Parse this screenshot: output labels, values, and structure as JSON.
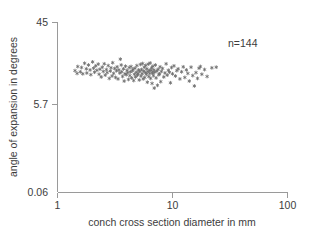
{
  "figure": {
    "background_color": "#ffffff",
    "axis_color": "#9a9a9a",
    "text_color": "#3c3c3c",
    "marker_color": "#6e6e6e"
  },
  "annotations": {
    "sample_size": "n=144"
  },
  "axes": {
    "x_title": "conch cross section diameter in mm",
    "y_title": "angle of expansion in degrees",
    "x_ticks": [
      "1",
      "10",
      "100"
    ],
    "y_ticks": [
      "45",
      "5.7",
      "0.06"
    ]
  },
  "chart_data": {
    "type": "scatter",
    "title": "",
    "xlabel": "conch cross section diameter in mm",
    "ylabel": "angle of expansion in degrees",
    "xscale": "log",
    "yscale": "log",
    "xlim": [
      1,
      100
    ],
    "ylim": [
      0.06,
      45
    ],
    "xticks": [
      1,
      10,
      100
    ],
    "yticks": [
      0.06,
      5.7,
      45
    ],
    "grid": false,
    "legend": null,
    "marker": "star",
    "marker_color": "#6e6e6e",
    "n": 144,
    "annotations": [
      {
        "text": "n=144",
        "x": 30.0,
        "y": 26.0
      }
    ],
    "points": [
      [
        1.42,
        6.9
      ],
      [
        1.5,
        8.1
      ],
      [
        1.48,
        6.2
      ],
      [
        1.58,
        6.6
      ],
      [
        1.62,
        7.8
      ],
      [
        1.66,
        6.1
      ],
      [
        1.72,
        9.2
      ],
      [
        1.78,
        7.4
      ],
      [
        1.8,
        6.3
      ],
      [
        1.86,
        8.6
      ],
      [
        1.92,
        7.1
      ],
      [
        1.95,
        5.9
      ],
      [
        2.02,
        9.7
      ],
      [
        2.06,
        7.6
      ],
      [
        2.1,
        6.5
      ],
      [
        2.15,
        8.3
      ],
      [
        2.2,
        7.0
      ],
      [
        2.26,
        8.9
      ],
      [
        2.3,
        6.0
      ],
      [
        2.34,
        7.3
      ],
      [
        2.4,
        5.4
      ],
      [
        2.45,
        7.9
      ],
      [
        2.5,
        6.7
      ],
      [
        2.55,
        9.0
      ],
      [
        2.6,
        5.8
      ],
      [
        2.66,
        7.2
      ],
      [
        2.7,
        6.4
      ],
      [
        2.76,
        8.4
      ],
      [
        2.82,
        5.1
      ],
      [
        2.88,
        6.8
      ],
      [
        2.92,
        7.7
      ],
      [
        2.98,
        5.6
      ],
      [
        3.02,
        9.4
      ],
      [
        3.08,
        6.2
      ],
      [
        3.14,
        7.5
      ],
      [
        3.2,
        5.3
      ],
      [
        3.26,
        6.9
      ],
      [
        3.3,
        8.0
      ],
      [
        3.36,
        5.0
      ],
      [
        3.42,
        7.1
      ],
      [
        3.48,
        6.3
      ],
      [
        3.52,
        10.8
      ],
      [
        3.58,
        8.6
      ],
      [
        3.62,
        6.6
      ],
      [
        3.68,
        5.5
      ],
      [
        3.74,
        7.4
      ],
      [
        3.8,
        4.6
      ],
      [
        3.86,
        6.1
      ],
      [
        3.9,
        8.2
      ],
      [
        3.96,
        5.9
      ],
      [
        4.02,
        7.0
      ],
      [
        4.08,
        6.4
      ],
      [
        4.14,
        4.9
      ],
      [
        4.2,
        7.8
      ],
      [
        4.26,
        5.7
      ],
      [
        4.3,
        6.6
      ],
      [
        4.36,
        8.1
      ],
      [
        4.42,
        5.2
      ],
      [
        4.48,
        6.9
      ],
      [
        4.54,
        7.3
      ],
      [
        4.6,
        4.7
      ],
      [
        4.66,
        6.0
      ],
      [
        4.72,
        7.6
      ],
      [
        4.78,
        5.4
      ],
      [
        4.84,
        6.5
      ],
      [
        4.9,
        8.4
      ],
      [
        4.96,
        5.8
      ],
      [
        5.02,
        6.2
      ],
      [
        5.08,
        7.1
      ],
      [
        5.14,
        4.8
      ],
      [
        5.2,
        6.7
      ],
      [
        5.26,
        8.8
      ],
      [
        5.32,
        5.6
      ],
      [
        5.38,
        7.2
      ],
      [
        5.44,
        6.1
      ],
      [
        5.5,
        9.1
      ],
      [
        5.56,
        5.0
      ],
      [
        5.62,
        6.8
      ],
      [
        5.68,
        7.9
      ],
      [
        5.74,
        5.3
      ],
      [
        5.8,
        6.4
      ],
      [
        5.86,
        8.5
      ],
      [
        5.92,
        6.0
      ],
      [
        5.98,
        7.4
      ],
      [
        6.04,
        4.4
      ],
      [
        6.1,
        6.6
      ],
      [
        6.16,
        8.9
      ],
      [
        6.22,
        5.5
      ],
      [
        6.28,
        7.0
      ],
      [
        6.34,
        6.2
      ],
      [
        6.4,
        9.3
      ],
      [
        6.46,
        5.1
      ],
      [
        6.52,
        6.9
      ],
      [
        6.58,
        7.7
      ],
      [
        6.64,
        4.2
      ],
      [
        6.7,
        6.3
      ],
      [
        6.76,
        8.2
      ],
      [
        6.82,
        5.7
      ],
      [
        6.88,
        7.1
      ],
      [
        6.94,
        3.5
      ],
      [
        7.0,
        6.5
      ],
      [
        7.1,
        8.6
      ],
      [
        7.2,
        5.2
      ],
      [
        7.3,
        6.8
      ],
      [
        7.4,
        3.9
      ],
      [
        7.5,
        7.3
      ],
      [
        7.6,
        5.9
      ],
      [
        7.7,
        6.1
      ],
      [
        7.8,
        8.0
      ],
      [
        7.9,
        4.5
      ],
      [
        8.0,
        6.7
      ],
      [
        8.2,
        7.5
      ],
      [
        8.4,
        5.4
      ],
      [
        8.6,
        6.3
      ],
      [
        8.8,
        9.0
      ],
      [
        9.0,
        5.8
      ],
      [
        9.2,
        7.0
      ],
      [
        9.4,
        6.5
      ],
      [
        9.6,
        4.3
      ],
      [
        9.8,
        7.8
      ],
      [
        10.0,
        6.1
      ],
      [
        10.3,
        8.3
      ],
      [
        10.6,
        5.6
      ],
      [
        10.9,
        6.9
      ],
      [
        11.2,
        7.4
      ],
      [
        11.6,
        5.0
      ],
      [
        12.0,
        6.6
      ],
      [
        12.4,
        8.0
      ],
      [
        12.8,
        5.3
      ],
      [
        13.2,
        7.1
      ],
      [
        13.6,
        6.2
      ],
      [
        14.0,
        4.6
      ],
      [
        14.5,
        7.9
      ],
      [
        15.0,
        5.7
      ],
      [
        15.5,
        3.8
      ],
      [
        16.0,
        6.4
      ],
      [
        16.5,
        5.1
      ],
      [
        17.0,
        7.6
      ],
      [
        17.5,
        8.1
      ],
      [
        18.0,
        6.0
      ],
      [
        19.0,
        7.2
      ],
      [
        20.0,
        5.5
      ],
      [
        22.0,
        7.7
      ],
      [
        24.0,
        7.9
      ]
    ]
  }
}
